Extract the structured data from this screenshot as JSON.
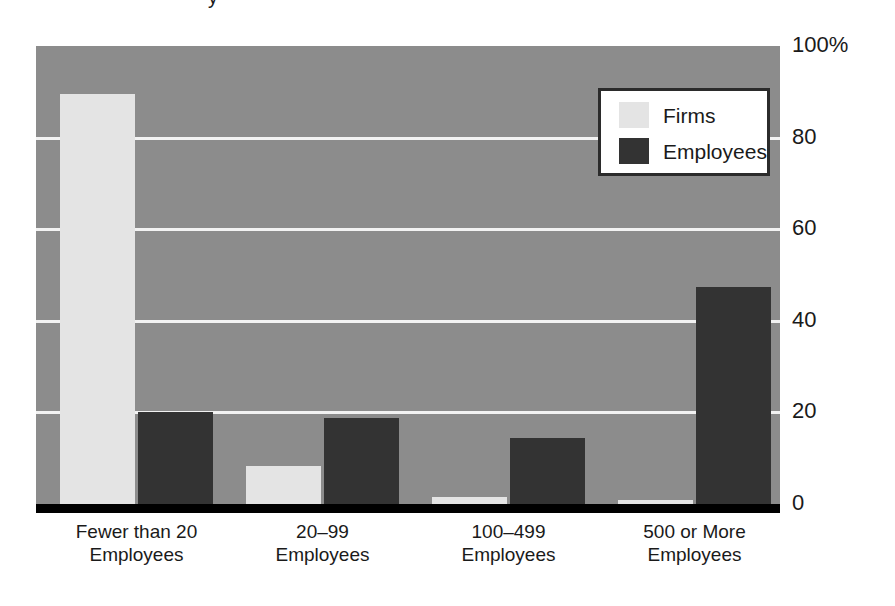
{
  "figure": {
    "cropped_title_remnant": "y",
    "background_color": "#ffffff",
    "plot_background_color": "#8c8c8c",
    "gridline_color": "#f2f2f2",
    "axis_color": "#000000"
  },
  "legend": {
    "position": "inside-top-right",
    "entries": [
      {
        "label": "Firms",
        "color": "#e4e4e4"
      },
      {
        "label": "Employees",
        "color": "#333333"
      }
    ]
  },
  "chart_data": {
    "type": "bar",
    "title": "",
    "xlabel": "",
    "ylabel": "",
    "ylim": [
      0,
      100
    ],
    "yticks": [
      0,
      20,
      40,
      60,
      80,
      100
    ],
    "ytick_labels": [
      "0",
      "20",
      "40",
      "60",
      "80",
      "100%"
    ],
    "grid": true,
    "legend_position": "inside-top-right",
    "categories": [
      "Fewer than 20\nEmployees",
      "20–99\nEmployees",
      "100–499\nEmployees",
      "500 or More\nEmployees"
    ],
    "category_lines": [
      [
        "Fewer than 20",
        "Employees"
      ],
      [
        "20–99",
        "Employees"
      ],
      [
        "100–499",
        "Employees"
      ],
      [
        "500 or More",
        "Employees"
      ]
    ],
    "series": [
      {
        "name": "Firms",
        "color": "#e4e4e4",
        "values": [
          89.5,
          8.3,
          1.5,
          0.9
        ]
      },
      {
        "name": "Employees",
        "color": "#333333",
        "values": [
          20.0,
          18.8,
          14.4,
          47.4
        ]
      }
    ]
  }
}
